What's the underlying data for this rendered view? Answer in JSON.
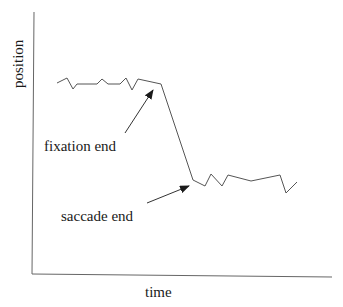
{
  "diagram": {
    "axes": {
      "y_label": "position",
      "x_label": "time"
    },
    "annotations": [
      {
        "id": "fixation",
        "label": "fixation end"
      },
      {
        "id": "saccade",
        "label": "saccade end"
      }
    ],
    "trace": {
      "description": "eye position over time: noisy fixation, steep saccade drop, noisy fixation",
      "points": [
        [
          57,
          83
        ],
        [
          67,
          78
        ],
        [
          73,
          89
        ],
        [
          77,
          84
        ],
        [
          97,
          84
        ],
        [
          102,
          79
        ],
        [
          108,
          84
        ],
        [
          120,
          84
        ],
        [
          126,
          78
        ],
        [
          132,
          90
        ],
        [
          138,
          79
        ],
        [
          161,
          84
        ],
        [
          193,
          180
        ],
        [
          205,
          186
        ],
        [
          211,
          174
        ],
        [
          222,
          186
        ],
        [
          228,
          175
        ],
        [
          251,
          181
        ],
        [
          280,
          175
        ],
        [
          286,
          193
        ],
        [
          297,
          182
        ]
      ]
    },
    "colors": {
      "line": "#555555",
      "axis": "#666666",
      "text": "#1a1a1a"
    }
  }
}
